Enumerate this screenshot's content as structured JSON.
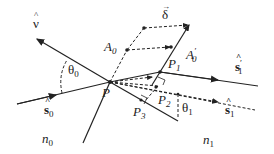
{
  "diagram": {
    "labels": {
      "nu": "ν",
      "delta": "δ",
      "A0": "A",
      "A0_sub": "0",
      "A0p": "A",
      "A0p_sub": "0",
      "A0p_prime": "′",
      "P": "P",
      "P1": "P",
      "P1_sub": "1",
      "P2_sub": "2",
      "P3": "P",
      "P3_sub": "3",
      "theta0": "θ",
      "theta0_sub": "0",
      "theta1": "θ",
      "theta1_sub": "1",
      "s0": "s",
      "s0_sub": "0",
      "s1": "s",
      "s1_sub": "1",
      "s1p": "s",
      "s1p_sub": "1",
      "s1p_prime": "′",
      "n0": "n",
      "n0_sub": "0",
      "n1": "n",
      "n1_sub": "1",
      "hat": "^",
      "arrow": "→"
    },
    "colors": {
      "line": "#222222",
      "background": "#ffffff"
    }
  }
}
